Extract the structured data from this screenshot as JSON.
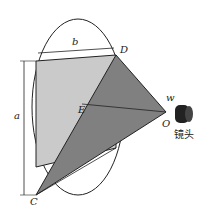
{
  "labels": {
    "b": "b",
    "D": "D",
    "a": "a",
    "E": "E",
    "w": "w",
    "O": "O",
    "C": "C",
    "lens": "镜头"
  },
  "colors": {
    "light": "#c8c8c8",
    "dark": "#7f7f7f",
    "line": "#222222"
  }
}
